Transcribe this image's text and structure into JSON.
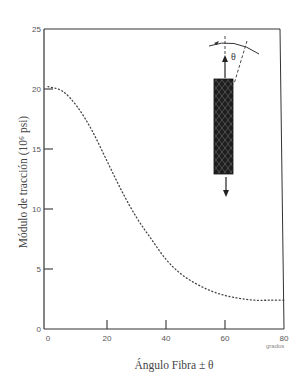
{
  "chart_data": {
    "type": "line",
    "title": "",
    "xlabel": "Ángulo Fibra ± θ",
    "x_unit": "grados",
    "ylabel": "Módulo de tracción (10⁶ psi)",
    "xlim": [
      0,
      80
    ],
    "ylim": [
      0,
      25
    ],
    "x_ticks": [
      0,
      20,
      40,
      60,
      80
    ],
    "y_ticks": [
      0,
      5,
      10,
      15,
      20,
      25
    ],
    "grid": false,
    "legend": null,
    "line_style": "dotted",
    "series": [
      {
        "name": "Módulo de tracción",
        "x": [
          0,
          5,
          10,
          15,
          20,
          25,
          30,
          35,
          40,
          45,
          50,
          55,
          60,
          65,
          70,
          75,
          80
        ],
        "values": [
          20.2,
          19.8,
          18.5,
          16.5,
          14.0,
          11.5,
          9.3,
          7.5,
          5.8,
          4.6,
          3.8,
          3.2,
          2.8,
          2.55,
          2.4,
          2.4,
          2.4
        ]
      }
    ],
    "annotations": [
      {
        "type": "inset-diagram",
        "description": "braided fiber specimen under tension with fiber angle θ marked",
        "label": "θ"
      }
    ]
  },
  "labels": {
    "x_ticks": [
      "0",
      "20",
      "40",
      "60",
      "80"
    ],
    "y_ticks": [
      "0",
      "5",
      "10",
      "15",
      "20",
      "25"
    ],
    "x_unit": "grados",
    "xlabel": "Ángulo Fibra ± θ",
    "ylabel": "Módulo de tracción (10⁶ psi)",
    "theta": "θ"
  },
  "colors": {
    "axis": "#333333",
    "curve": "#444444",
    "specimen": "#1e1e1e",
    "text": "#555555"
  }
}
